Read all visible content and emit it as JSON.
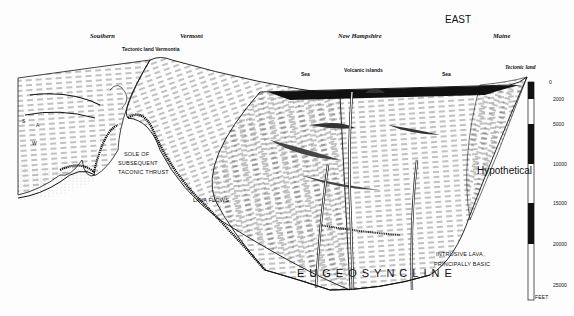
{
  "direction": "EAST",
  "regions": [
    "Southern",
    "Vermont",
    "New Hampshire",
    "Maine"
  ],
  "features": {
    "tectonic_land_vermontia": "Tectonic land Vermontia",
    "sea_left": "Sea",
    "volcanic_islands": "Volcanic islands",
    "sea_right": "Sea",
    "tectonic_land_east": "Tectonic land"
  },
  "annotations": {
    "strata_s": "S",
    "strata_a": "A",
    "strata_w": "W",
    "sole_line1": "SOLE OF",
    "sole_line2": "SUBSEQUENT",
    "sole_line3": "TACONIC THRUST",
    "lava_flows": "LAVA FLOWS",
    "intrusive_line1": "INTRUSIVE LAVA,",
    "intrusive_line2": "PRINCIPALLY BASIC",
    "hypothetical": "Hypothetical",
    "title": "EUGEOSYNCLINE"
  },
  "scale": {
    "unit": "FEET",
    "ticks": [
      "0",
      "2000",
      "5000",
      "10000",
      "15000",
      "20000",
      "25000"
    ]
  }
}
